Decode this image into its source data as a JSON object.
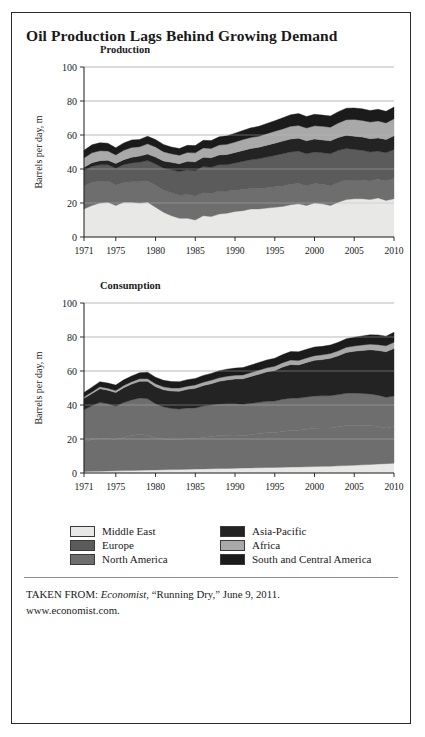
{
  "figure": {
    "title": "Oil Production Lags Behind Growing Demand"
  },
  "source": {
    "prefix": "TAKEN FROM: ",
    "publication": "Economist",
    "article": ", “Running Dry,” June 9, 2011.",
    "website": "www.economist.com."
  },
  "legend": {
    "items": [
      {
        "label": "Middle East",
        "color": "#e8e8e6"
      },
      {
        "label": "Europe",
        "color": "#5b5b5b"
      },
      {
        "label": "North America",
        "color": "#6e6e6e"
      },
      {
        "label": "Asia-Pacific",
        "color": "#232323"
      },
      {
        "label": "Africa",
        "color": "#a9a9a9"
      },
      {
        "label": "South and Central America",
        "color": "#1b1b1b"
      }
    ]
  },
  "chart_data": [
    {
      "type": "area",
      "title": "Production",
      "xlabel": "",
      "ylabel": "Barrels per day, m",
      "stacked": true,
      "grid": true,
      "legend_position": "bottom",
      "ylim": [
        0,
        100
      ],
      "yticks": [
        0,
        20,
        40,
        60,
        80,
        100
      ],
      "xlim": [
        1971,
        2010
      ],
      "xticks": [
        1971,
        1975,
        1980,
        1985,
        1990,
        1995,
        2000,
        2005,
        2010
      ],
      "x": [
        1971,
        1972,
        1973,
        1974,
        1975,
        1976,
        1977,
        1978,
        1979,
        1980,
        1981,
        1982,
        1983,
        1984,
        1985,
        1986,
        1987,
        1988,
        1989,
        1990,
        1991,
        1992,
        1993,
        1994,
        1995,
        1996,
        1997,
        1998,
        1999,
        2000,
        2001,
        2002,
        2003,
        2004,
        2005,
        2006,
        2007,
        2008,
        2009,
        2010
      ],
      "series": [
        {
          "name": "Middle East",
          "color": "#e8e8e6",
          "values": [
            16.5,
            18.5,
            20.0,
            20.5,
            18.5,
            20.5,
            20.5,
            20.0,
            20.5,
            17.5,
            14.5,
            12.5,
            11.0,
            11.0,
            10.0,
            12.5,
            12.0,
            13.5,
            14.0,
            15.0,
            15.5,
            16.5,
            16.5,
            17.0,
            17.5,
            18.0,
            19.0,
            19.5,
            18.5,
            20.0,
            19.5,
            18.5,
            20.5,
            22.0,
            22.5,
            22.5,
            22.0,
            23.0,
            21.5,
            22.5
          ]
        },
        {
          "name": "North America",
          "color": "#6e6e6e",
          "values": [
            13.5,
            13.5,
            13.0,
            12.5,
            12.0,
            11.5,
            12.0,
            12.5,
            12.5,
            13.0,
            13.0,
            13.5,
            13.5,
            14.0,
            14.0,
            13.5,
            13.5,
            13.5,
            13.0,
            12.5,
            12.5,
            12.0,
            12.0,
            12.0,
            12.0,
            12.0,
            12.0,
            12.0,
            11.5,
            11.5,
            11.5,
            11.5,
            11.5,
            11.5,
            11.0,
            11.0,
            11.0,
            11.0,
            11.5,
            12.0
          ]
        },
        {
          "name": "Europe",
          "color": "#5b5b5b",
          "values": [
            9.0,
            9.5,
            9.5,
            9.5,
            10.0,
            10.5,
            11.0,
            11.5,
            12.0,
            12.5,
            13.0,
            13.5,
            14.0,
            14.5,
            15.0,
            15.5,
            15.5,
            15.5,
            15.5,
            16.0,
            16.5,
            17.0,
            17.5,
            18.0,
            18.5,
            19.0,
            19.0,
            19.0,
            19.0,
            18.5,
            18.5,
            19.0,
            19.0,
            18.5,
            18.0,
            17.5,
            17.0,
            16.5,
            16.5,
            17.0
          ]
        },
        {
          "name": "Asia-Pacific",
          "color": "#232323",
          "values": [
            2.0,
            2.2,
            2.4,
            2.6,
            2.8,
            3.0,
            3.4,
            3.6,
            3.8,
            4.0,
            4.2,
            4.4,
            4.6,
            5.0,
            5.2,
            5.4,
            5.6,
            5.8,
            6.0,
            6.2,
            6.4,
            6.6,
            6.8,
            7.0,
            7.2,
            7.4,
            7.6,
            7.6,
            7.6,
            7.6,
            7.6,
            7.6,
            7.6,
            7.8,
            7.8,
            7.8,
            7.8,
            7.8,
            7.8,
            8.0
          ]
        },
        {
          "name": "Africa",
          "color": "#a9a9a9",
          "values": [
            5.5,
            5.8,
            5.8,
            5.5,
            5.0,
            5.5,
            5.8,
            5.5,
            6.0,
            6.0,
            5.5,
            5.0,
            5.0,
            5.2,
            5.3,
            5.5,
            5.5,
            5.8,
            6.0,
            6.2,
            6.4,
            6.5,
            6.5,
            6.8,
            7.0,
            7.2,
            7.5,
            7.5,
            7.5,
            7.8,
            8.0,
            8.0,
            8.5,
            9.2,
            9.8,
            9.8,
            9.8,
            10.0,
            9.8,
            10.0
          ]
        },
        {
          "name": "South and Central America",
          "color": "#1b1b1b",
          "values": [
            4.5,
            4.7,
            4.8,
            4.5,
            4.2,
            4.3,
            4.4,
            4.3,
            4.5,
            4.3,
            4.2,
            4.0,
            4.0,
            4.2,
            4.3,
            4.5,
            4.6,
            4.8,
            5.0,
            5.2,
            5.4,
            5.6,
            5.8,
            6.0,
            6.2,
            6.5,
            6.8,
            7.0,
            6.8,
            6.8,
            6.6,
            6.6,
            6.6,
            6.8,
            6.8,
            6.8,
            6.8,
            6.8,
            6.8,
            7.0
          ]
        }
      ]
    },
    {
      "type": "area",
      "title": "Consumption",
      "xlabel": "",
      "ylabel": "Barrels per day, m",
      "stacked": true,
      "grid": true,
      "legend_position": "bottom",
      "ylim": [
        0,
        100
      ],
      "yticks": [
        0,
        20,
        40,
        60,
        80,
        100
      ],
      "xlim": [
        1971,
        2010
      ],
      "xticks": [
        1971,
        1975,
        1980,
        1985,
        1990,
        1995,
        2000,
        2005,
        2010
      ],
      "x": [
        1971,
        1972,
        1973,
        1974,
        1975,
        1976,
        1977,
        1978,
        1979,
        1980,
        1981,
        1982,
        1983,
        1984,
        1985,
        1986,
        1987,
        1988,
        1989,
        1990,
        1991,
        1992,
        1993,
        1994,
        1995,
        1996,
        1997,
        1998,
        1999,
        2000,
        2001,
        2002,
        2003,
        2004,
        2005,
        2006,
        2007,
        2008,
        2009,
        2010
      ],
      "series": [
        {
          "name": "Middle East",
          "color": "#e8e8e6",
          "values": [
            0.9,
            1.0,
            1.1,
            1.2,
            1.3,
            1.4,
            1.5,
            1.6,
            1.7,
            1.8,
            1.9,
            2.0,
            2.1,
            2.2,
            2.3,
            2.4,
            2.5,
            2.6,
            2.7,
            2.8,
            2.9,
            3.0,
            3.1,
            3.2,
            3.3,
            3.4,
            3.5,
            3.6,
            3.7,
            3.8,
            3.9,
            4.0,
            4.2,
            4.4,
            4.6,
            4.8,
            5.0,
            5.3,
            5.5,
            5.8
          ]
        },
        {
          "name": "North America",
          "color": "#6e6e6e",
          "values": [
            17.5,
            18.5,
            19.5,
            19.0,
            18.5,
            19.5,
            20.5,
            21.0,
            20.5,
            19.0,
            18.0,
            17.5,
            17.5,
            18.0,
            18.0,
            18.5,
            19.0,
            19.5,
            19.5,
            19.5,
            19.0,
            19.5,
            20.0,
            20.5,
            20.5,
            21.0,
            21.5,
            21.5,
            22.0,
            22.5,
            22.5,
            22.5,
            23.0,
            23.5,
            23.5,
            23.0,
            23.0,
            22.0,
            21.0,
            21.5
          ]
        },
        {
          "name": "Europe",
          "color": "#6e6e6e",
          "values": [
            19.0,
            20.0,
            21.0,
            20.5,
            19.5,
            20.5,
            21.0,
            21.5,
            21.5,
            20.0,
            19.0,
            18.5,
            18.0,
            18.0,
            18.0,
            18.5,
            18.5,
            18.5,
            18.5,
            18.5,
            18.5,
            18.5,
            18.5,
            18.5,
            18.5,
            19.0,
            19.0,
            19.0,
            19.0,
            19.0,
            19.0,
            19.0,
            19.0,
            19.0,
            19.0,
            19.0,
            18.5,
            18.5,
            18.0,
            18.0
          ]
        },
        {
          "name": "Asia-Pacific",
          "color": "#232323",
          "values": [
            6.5,
            7.2,
            8.0,
            8.0,
            8.0,
            8.8,
            9.3,
            9.8,
            10.2,
            10.0,
            10.0,
            10.2,
            10.5,
            11.0,
            11.5,
            12.0,
            12.5,
            13.3,
            14.0,
            14.5,
            15.0,
            15.8,
            16.5,
            17.3,
            18.0,
            19.0,
            19.8,
            19.5,
            20.3,
            21.0,
            21.3,
            22.0,
            22.8,
            24.0,
            24.5,
            25.3,
            26.0,
            26.3,
            26.8,
            28.0
          ]
        },
        {
          "name": "Africa",
          "color": "#a9a9a9",
          "values": [
            0.9,
            1.0,
            1.1,
            1.1,
            1.2,
            1.3,
            1.4,
            1.5,
            1.6,
            1.7,
            1.8,
            1.8,
            1.9,
            1.9,
            2.0,
            2.0,
            2.1,
            2.1,
            2.2,
            2.2,
            2.3,
            2.3,
            2.4,
            2.4,
            2.5,
            2.5,
            2.6,
            2.6,
            2.7,
            2.7,
            2.8,
            2.8,
            2.9,
            3.0,
            3.1,
            3.2,
            3.3,
            3.4,
            3.5,
            3.6
          ]
        },
        {
          "name": "South and Central America",
          "color": "#1b1b1b",
          "values": [
            2.6,
            2.8,
            3.0,
            3.1,
            3.2,
            3.3,
            3.4,
            3.6,
            3.8,
            3.8,
            3.8,
            3.8,
            3.7,
            3.8,
            3.8,
            3.9,
            4.0,
            4.1,
            4.2,
            4.2,
            4.3,
            4.4,
            4.5,
            4.6,
            4.7,
            4.8,
            5.0,
            5.1,
            5.1,
            5.1,
            5.0,
            5.0,
            5.0,
            5.1,
            5.2,
            5.3,
            5.5,
            5.7,
            5.7,
            5.9
          ]
        }
      ]
    }
  ]
}
